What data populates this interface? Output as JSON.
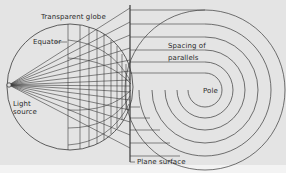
{
  "figure": {
    "colors": {
      "background": "#e4e4e4",
      "page": "#f3f3f3",
      "line": "#3a3a3a",
      "text": "#2a2a2a"
    },
    "labels": {
      "transparent_globe": "Transparent globe",
      "equator": "Equator",
      "light_source_line1": "Light",
      "light_source_line2": "source",
      "spacing_line1": "Spacing of",
      "spacing_line2": "parallels",
      "pole": "Pole",
      "plane_surface": "Plane surface"
    },
    "geometry": {
      "globe": {
        "cx": 70,
        "cy": 87,
        "r": 63
      },
      "light_source": {
        "x": 9,
        "y": 85
      },
      "plane_x": 130,
      "pole_center": {
        "cx": 205,
        "cy": 90
      },
      "parallel_radii": [
        80,
        66,
        53,
        40,
        28,
        17
      ]
    }
  }
}
